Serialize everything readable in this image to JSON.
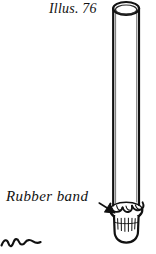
{
  "figure": {
    "caption": "Illus. 76",
    "background_color": "#ffffff",
    "ink_color": "#111111"
  },
  "labels": [
    {
      "key": "caption",
      "text": "Illus. 76",
      "style": "italic-serif",
      "position": "top-center-left"
    },
    {
      "key": "rubber_band",
      "text": "Rubber band",
      "style": "italic-serif",
      "position": "left-lower"
    }
  ],
  "annotations": {
    "pointer": {
      "name": "arrow-to-rubber-band",
      "points_to": "rubber band around tube mouth",
      "direction": "right-down"
    }
  },
  "parts": {
    "tube": {
      "name": "glass-tube",
      "shape": "open cylinder",
      "rim": "ellipse"
    },
    "membrane": {
      "name": "cloth-membrane",
      "shape": "gathered fabric bunched over tube opening"
    },
    "band": {
      "name": "rubber-band",
      "shape": "ring around gathered cloth"
    },
    "gathered_cloth": {
      "name": "gathered-cloth-cup",
      "shape": "rounded cup with vertical folds"
    },
    "stray_mark": {
      "name": "stray-squiggle-mark",
      "shape": "small wavy line"
    }
  }
}
